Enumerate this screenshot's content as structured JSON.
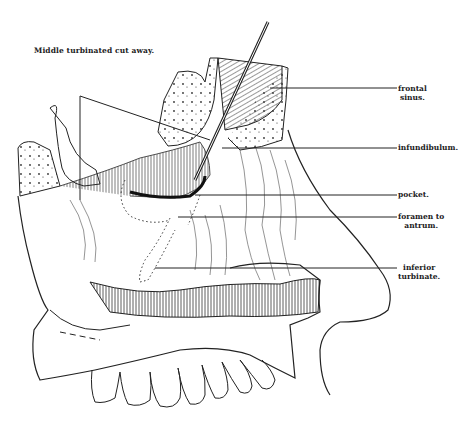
{
  "figure": {
    "caption": "Middle turbinated cut away.",
    "labels": {
      "frontal_sinus": [
        "frontal",
        "sinus."
      ],
      "infundibulum": [
        "infundibulum."
      ],
      "pocket": [
        "pocket."
      ],
      "foramen": [
        "foramen to",
        "antrum."
      ],
      "inferior_turbinate": [
        "inferior",
        "turbinate."
      ]
    },
    "colors": {
      "ink": "#222222",
      "background": "#ffffff"
    }
  }
}
